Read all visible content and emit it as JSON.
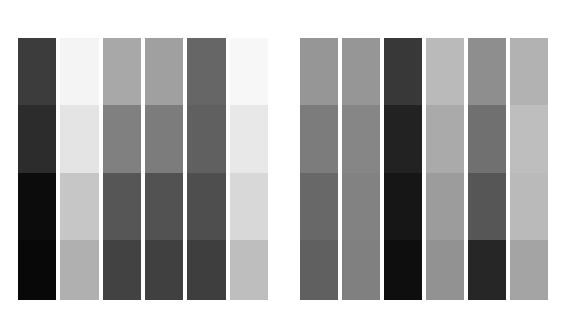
{
  "figure": {
    "type": "heatmap-matrix",
    "background": "#ffffff",
    "width": 562,
    "height": 330
  },
  "chart_data": {
    "type": "heatmap",
    "title": "",
    "subtitle": "",
    "xlabel": "",
    "ylabel": "",
    "grid": false,
    "legend_position": "none",
    "colormap": "grayscale",
    "value_range": [
      0,
      255
    ],
    "note": "Two side-by-side grayscale column-matrix panels. Each panel has 6 columns and 4 horizontal bands; every cell is a flat gray level (0=black, 255=white).",
    "panels": [
      {
        "name": "left-panel",
        "x_px": 18,
        "y_px": 38,
        "width_px": 250,
        "height_px": 262,
        "categories": [
          "C1",
          "C2",
          "C3",
          "C4",
          "C5",
          "C6"
        ],
        "rows": [
          "R1",
          "R2",
          "R3",
          "R4"
        ],
        "row_boundaries_px": [
          38,
          105,
          173,
          240,
          300
        ],
        "values": [
          [
            60,
            244,
            168,
            160,
            102,
            247
          ],
          [
            44,
            228,
            128,
            124,
            96,
            232
          ],
          [
            12,
            198,
            86,
            82,
            78,
            216
          ],
          [
            8,
            176,
            66,
            64,
            62,
            190
          ]
        ],
        "colors": [
          [
            "#3c3c3c",
            "#f4f4f4",
            "#a8a8a8",
            "#a0a0a0",
            "#666666",
            "#f7f7f7"
          ],
          [
            "#2c2c2c",
            "#e4e4e4",
            "#808080",
            "#7c7c7c",
            "#606060",
            "#e8e8e8"
          ],
          [
            "#0c0c0c",
            "#c6c6c6",
            "#565656",
            "#525252",
            "#4e4e4e",
            "#d8d8d8"
          ],
          [
            "#080808",
            "#b0b0b0",
            "#424242",
            "#404040",
            "#3e3e3e",
            "#bebebe"
          ]
        ]
      },
      {
        "name": "right-panel",
        "x_px": 300,
        "y_px": 38,
        "width_px": 248,
        "height_px": 262,
        "categories": [
          "C1",
          "C2",
          "C3",
          "C4",
          "C5",
          "C6"
        ],
        "rows": [
          "R1",
          "R2",
          "R3",
          "R4"
        ],
        "row_boundaries_px": [
          38,
          105,
          173,
          240,
          300
        ],
        "values": [
          [
            150,
            150,
            56,
            186,
            142,
            178
          ],
          [
            124,
            134,
            34,
            170,
            112,
            190
          ],
          [
            104,
            130,
            22,
            156,
            86,
            186
          ],
          [
            96,
            128,
            14,
            146,
            38,
            164
          ]
        ],
        "colors": [
          [
            "#969696",
            "#969696",
            "#383838",
            "#babab a",
            "#8e8e8e",
            "#b2b2b2"
          ],
          [
            "#7c7c7c",
            "#868686",
            "#222222",
            "#aaaaaa",
            "#707070",
            "#bebebe"
          ],
          [
            "#686868",
            "#828282",
            "#161616",
            "#9c9c9c",
            "#565656",
            "#bababa"
          ],
          [
            "#606060",
            "#808080",
            "#0e0e0e",
            "#929292",
            "#262626",
            "#a4a4a4"
          ]
        ]
      }
    ]
  },
  "layout": {
    "column_width_px": 38,
    "column_gap_px": 4,
    "panel_gap_px": 32
  }
}
